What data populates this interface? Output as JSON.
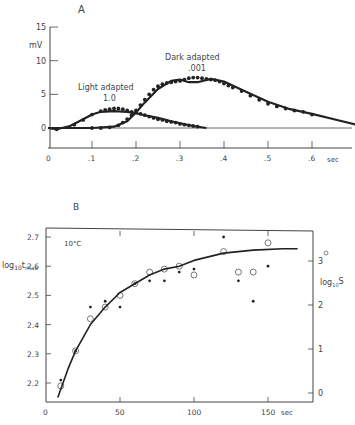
{
  "chart_data": [
    {
      "panel": "A",
      "type": "line",
      "title": "A",
      "xlabel": "sec",
      "ylabel": "mV",
      "xlim": [
        0,
        0.7
      ],
      "ylim": [
        -3,
        15
      ],
      "x_ticks": [
        "0",
        ".1",
        ".2",
        ".3",
        ".4",
        ".5",
        ".6"
      ],
      "y_ticks": [
        "0",
        "5",
        "10",
        "15"
      ],
      "grid": false,
      "annotations": [
        {
          "text": "Light adapted",
          "sub": "1.0"
        },
        {
          "text": "Dark adapted",
          "sub": ".001"
        }
      ],
      "series": [
        {
          "name": "Light adapted 1.0 (fit)",
          "style": "solid-line",
          "x": [
            0,
            0.02,
            0.05,
            0.08,
            0.1,
            0.12,
            0.15,
            0.18,
            0.2,
            0.22,
            0.25,
            0.28,
            0.3,
            0.33,
            0.36
          ],
          "y": [
            0,
            -0.2,
            0.3,
            1.3,
            2.0,
            2.4,
            2.5,
            2.4,
            2.2,
            1.9,
            1.5,
            1.0,
            0.7,
            0.3,
            0.0
          ]
        },
        {
          "name": "Light adapted 1.0 (data)",
          "style": "dots",
          "x": [
            0.02,
            0.06,
            0.08,
            0.1,
            0.12,
            0.13,
            0.14,
            0.15,
            0.16,
            0.17,
            0.18,
            0.19,
            0.2,
            0.21,
            0.22,
            0.23,
            0.24,
            0.25,
            0.26,
            0.27,
            0.28,
            0.29,
            0.3,
            0.31,
            0.32,
            0.33,
            0.34
          ],
          "y": [
            -0.2,
            0.5,
            1.2,
            2.0,
            2.5,
            2.7,
            2.8,
            2.9,
            2.9,
            2.8,
            2.6,
            2.4,
            2.3,
            2.1,
            1.9,
            1.7,
            1.5,
            1.3,
            1.2,
            1.0,
            0.9,
            0.8,
            0.6,
            0.5,
            0.4,
            0.3,
            0.2
          ]
        },
        {
          "name": "Dark adapted .001 (fit)",
          "style": "solid-line",
          "x": [
            0,
            0.1,
            0.15,
            0.18,
            0.2,
            0.22,
            0.25,
            0.28,
            0.3,
            0.32,
            0.34,
            0.37,
            0.4,
            0.45,
            0.5,
            0.55,
            0.6,
            0.65,
            0.7
          ],
          "y": [
            0,
            0,
            0.2,
            1.0,
            2.3,
            3.8,
            5.8,
            7.0,
            7.2,
            6.8,
            6.8,
            7.3,
            6.9,
            5.4,
            3.9,
            2.8,
            2.1,
            1.3,
            0.5
          ]
        },
        {
          "name": "Dark adapted .001 (data)",
          "style": "dots",
          "x": [
            0.1,
            0.12,
            0.14,
            0.16,
            0.17,
            0.18,
            0.19,
            0.2,
            0.21,
            0.22,
            0.23,
            0.24,
            0.25,
            0.26,
            0.27,
            0.28,
            0.29,
            0.3,
            0.31,
            0.32,
            0.33,
            0.34,
            0.35,
            0.36,
            0.37,
            0.38,
            0.39,
            0.4,
            0.41,
            0.42,
            0.44,
            0.46,
            0.48,
            0.5,
            0.52,
            0.54,
            0.56,
            0.58,
            0.6
          ],
          "y": [
            0,
            0,
            0.1,
            0.4,
            0.8,
            1.3,
            1.9,
            2.6,
            3.4,
            4.2,
            5.0,
            5.7,
            6.2,
            6.5,
            6.7,
            6.8,
            6.9,
            7.0,
            7.2,
            7.4,
            7.5,
            7.5,
            7.4,
            7.3,
            7.2,
            7.1,
            6.9,
            6.6,
            6.3,
            6.0,
            5.5,
            4.8,
            4.2,
            3.6,
            3.2,
            2.9,
            2.6,
            2.4,
            2.0
          ]
        }
      ]
    },
    {
      "panel": "B",
      "type": "scatter",
      "title": "B",
      "annotation": "10°C",
      "xlabel": "sec",
      "ylabel": "log10 t max",
      "ylabel_right": "log10 S",
      "xlim": [
        0,
        180
      ],
      "ylim": [
        2.14,
        2.72
      ],
      "ylim_right": [
        -0.2,
        3.7
      ],
      "x_ticks": [
        "0",
        "50",
        "100",
        "150 sec"
      ],
      "y_ticks": [
        "2.2",
        "2.3",
        "2.4",
        "2.5",
        "2.6",
        "2.7"
      ],
      "y_ticks_right": [
        "0",
        "1",
        "2",
        "3"
      ],
      "grid": false,
      "legend": {
        "open_circle": "log10 t max",
        "filled_dot": "log10 S"
      },
      "series": [
        {
          "name": "log10 t max (open circles)",
          "marker": "open-circle",
          "x": [
            10,
            20,
            30,
            40,
            50,
            60,
            70,
            80,
            90,
            100,
            120,
            130,
            140,
            150
          ],
          "y": [
            2.19,
            2.31,
            2.42,
            2.46,
            2.5,
            2.54,
            2.58,
            2.59,
            2.6,
            2.57,
            2.65,
            2.58,
            2.58,
            2.68
          ]
        },
        {
          "name": "log10 S (filled dots)",
          "marker": "filled-dot",
          "x": [
            10,
            20,
            30,
            40,
            50,
            60,
            70,
            80,
            90,
            100,
            120,
            130,
            140,
            150
          ],
          "y": [
            2.21,
            2.31,
            2.46,
            2.48,
            2.46,
            2.54,
            2.55,
            2.55,
            2.58,
            2.59,
            2.7,
            2.55,
            2.48,
            2.6
          ]
        },
        {
          "name": "fit curve",
          "style": "solid-line",
          "x": [
            8,
            15,
            20,
            30,
            40,
            50,
            60,
            70,
            80,
            90,
            100,
            120,
            140,
            160,
            170
          ],
          "y": [
            2.15,
            2.25,
            2.31,
            2.4,
            2.46,
            2.51,
            2.54,
            2.57,
            2.59,
            2.6,
            2.62,
            2.645,
            2.655,
            2.66,
            2.66
          ]
        }
      ]
    }
  ],
  "labels": {
    "panelA": "A",
    "panelB": "B",
    "mV": "mV",
    "light": "Light adapted",
    "light_sub": "1.0",
    "dark": "Dark adapted",
    "dark_sub": ".001",
    "secA": "sec",
    "temp": "10°C",
    "ylabelB_main": "log",
    "ylabelB_sub": "10",
    "ylabelB_t": "t",
    "ylabelB_max": "max",
    "ylabelR_main": "log",
    "ylabelR_sub": "10",
    "ylabelR_S": "S",
    "secB": "sec"
  }
}
